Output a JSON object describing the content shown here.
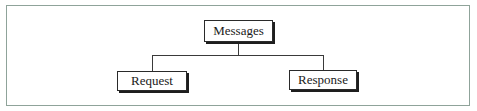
{
  "diagram": {
    "type": "hierarchy-tree",
    "root": {
      "id": "messages",
      "label": "Messages"
    },
    "children": [
      {
        "id": "request",
        "label": "Request"
      },
      {
        "id": "response",
        "label": "Response"
      }
    ],
    "edges": [
      {
        "from": "messages",
        "to": "request"
      },
      {
        "from": "messages",
        "to": "response"
      }
    ],
    "colors": {
      "frame_border": "#8fa39a",
      "node_border": "#2a2a2a",
      "node_shadow": "#1e1e1e",
      "connector": "#3a3a3a"
    }
  }
}
